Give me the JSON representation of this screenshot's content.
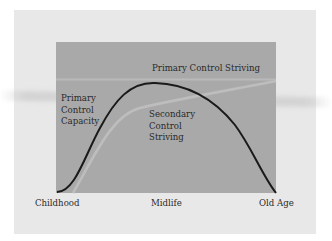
{
  "diagram": {
    "type": "lifespan-control-theory-curves",
    "colors": {
      "outer_panel": "#e8e8e8",
      "plot_area": "#a9a9a9",
      "primary_capacity_curve": "#1a1a1a",
      "secondary_striving_curve": "#bdbdbd",
      "primary_striving_line": "#b8b8b8"
    },
    "curves": [
      {
        "id": "primary-control-capacity",
        "label_lines": [
          "Primary",
          "Control",
          "Capacity"
        ],
        "shape": "inverted-U peaking near midlife"
      },
      {
        "id": "secondary-control-striving",
        "label_lines": [
          "Secondary",
          "Control",
          "Striving"
        ],
        "shape": "rises steeply then increases gradually"
      },
      {
        "id": "primary-control-striving",
        "label": "Primary Control Striving",
        "shape": "flat horizontal line"
      }
    ],
    "labels": {
      "primary_striving": "Primary Control Striving",
      "primary_capacity": [
        "Primary",
        "Control",
        "Capacity"
      ],
      "secondary_striving": [
        "Secondary",
        "Control",
        "Striving"
      ]
    },
    "x_axis": {
      "ticks": [
        "Childhood",
        "Midlife",
        "Old Age"
      ]
    }
  }
}
